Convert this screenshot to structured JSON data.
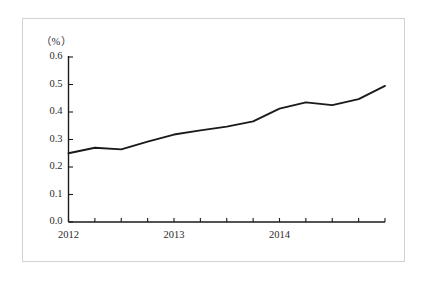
{
  "figure": {
    "background_color": "#ffffff",
    "frame_color": "#d2d2d2",
    "axis_color": "#1a1a1a",
    "line_color": "#1a1a1a",
    "text_color": "#2b2b2b",
    "unit_label": "（%）"
  },
  "chart_data": {
    "type": "line",
    "title": "",
    "subtitle": "",
    "xlabel": "",
    "ylabel": "",
    "unit": "%",
    "grid": false,
    "legend": null,
    "ylim": [
      0.0,
      0.6
    ],
    "ytick_labels": [
      "0.0",
      "0.1",
      "0.2",
      "0.3",
      "0.4",
      "0.5",
      "0.6"
    ],
    "ytick_values": [
      0.0,
      0.1,
      0.2,
      0.3,
      0.4,
      0.5,
      0.6
    ],
    "xtick_labels": [
      "2012",
      "2013",
      "2014"
    ],
    "xtick_label_positions": [
      0,
      4,
      8
    ],
    "x_tick_count": 13,
    "categories": [
      "2012Q1",
      "2012Q2",
      "2012Q3",
      "2012Q4",
      "2013Q1",
      "2013Q2",
      "2013Q3",
      "2013Q4",
      "2014Q1",
      "2014Q2",
      "2014Q3",
      "2014Q4",
      "2015Q1"
    ],
    "series": [
      {
        "name": "",
        "values": [
          0.25,
          0.27,
          0.264,
          0.292,
          0.318,
          0.333,
          0.347,
          0.366,
          0.412,
          0.435,
          0.425,
          0.447,
          0.495
        ]
      }
    ]
  }
}
